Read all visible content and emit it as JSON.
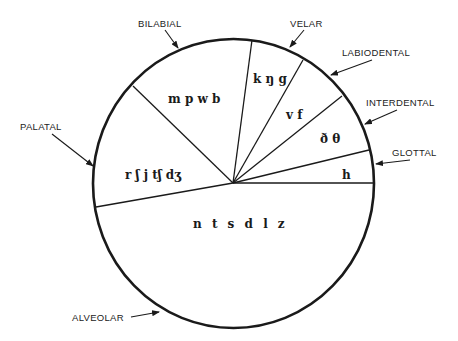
{
  "diagram": {
    "type": "pie-diagram",
    "colors": {
      "stroke": "#1a1a1a",
      "background": "#ffffff"
    },
    "sectors": [
      {
        "name": "bilabial",
        "label": "BILABIAL",
        "sounds": "m p w b"
      },
      {
        "name": "velar",
        "label": "VELAR",
        "sounds": "k ŋ g"
      },
      {
        "name": "labiodental",
        "label": "LABIODENTAL",
        "sounds": "v f"
      },
      {
        "name": "interdental",
        "label": "INTERDENTAL",
        "sounds": "ð θ"
      },
      {
        "name": "glottal",
        "label": "GLOTTAL",
        "sounds": "h"
      },
      {
        "name": "alveolar",
        "label": "ALVEOLAR",
        "sounds": "n t s d l z"
      },
      {
        "name": "palatal",
        "label": "PALATAL",
        "sounds": "r ʃ j tʃ dʒ"
      }
    ]
  }
}
